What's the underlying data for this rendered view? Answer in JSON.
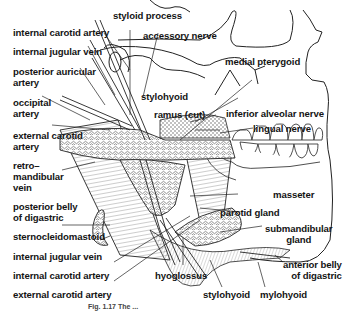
{
  "figure": {
    "type": "anatomical line drawing",
    "caption": "Fig. 1.17 The ..."
  },
  "labels": {
    "left": [
      {
        "id": "internal-carotid-artery-top",
        "text": "internal carotid artery"
      },
      {
        "id": "internal-jugular-vein-top",
        "text": "internal jugular vein"
      },
      {
        "id": "posterior-auricular-artery",
        "text": "posterior auricular artery",
        "lines": [
          "posterior auricular",
          "artery"
        ]
      },
      {
        "id": "occipital-artery",
        "text": "occipital artery",
        "lines": [
          "occipital",
          "artery"
        ]
      },
      {
        "id": "external-carotid-artery-mid",
        "text": "external carotid artery",
        "lines": [
          "external carotid",
          "artery"
        ]
      },
      {
        "id": "retromandibular-vein",
        "text": "retro- mandibular vein",
        "lines": [
          "retro–",
          "mandibular",
          "vein"
        ]
      },
      {
        "id": "posterior-belly-of-digastric",
        "text": "posterior belly of digastric",
        "lines": [
          "posterior belly",
          "of digastric"
        ]
      },
      {
        "id": "sternocleidomastoid",
        "text": "sternocleidomastoid"
      },
      {
        "id": "internal-jugular-vein-bottom",
        "text": "internal jugular vein"
      },
      {
        "id": "internal-carotid-artery-bottom",
        "text": "internal carotid artery"
      },
      {
        "id": "external-carotid-artery-bottom",
        "text": "external carotid artery"
      }
    ],
    "top": [
      {
        "id": "styloid-process",
        "text": "styloid process"
      },
      {
        "id": "accessory-nerve",
        "text": "accessory nerve"
      },
      {
        "id": "stylohyoid-top",
        "text": "stylohyoid"
      },
      {
        "id": "ramus-cut",
        "text": "ramus (cut)"
      },
      {
        "id": "medial-pterygoid",
        "text": "medial pterygoid"
      }
    ],
    "right": [
      {
        "id": "inferior-alveolar-nerve",
        "text": "inferior alveolar nerve"
      },
      {
        "id": "lingual-nerve",
        "text": "lingual nerve"
      },
      {
        "id": "masseter",
        "text": "masseter"
      },
      {
        "id": "parotid-gland",
        "text": "parotid gland"
      },
      {
        "id": "submandibular-gland",
        "text": "submandibular gland",
        "lines": [
          "submandibular",
          "gland"
        ]
      },
      {
        "id": "anterior-belly-of-digastric",
        "text": "anterior belly of digastric",
        "lines": [
          "anterior belly",
          "of digastric"
        ]
      }
    ],
    "bottom": [
      {
        "id": "hyoglossus",
        "text": "hyoglossus"
      },
      {
        "id": "stylohyoid-bottom",
        "text": "stylohyoid"
      },
      {
        "id": "mylohyoid",
        "text": "mylohyoid"
      }
    ]
  },
  "colors": {
    "ink": "#141414",
    "background": "#ffffff"
  }
}
